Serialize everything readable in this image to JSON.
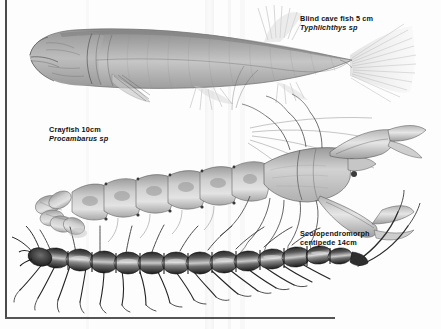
{
  "plate": {
    "title": "Cave fauna illustration plate",
    "background_color": "#fdfdfd",
    "border_color": "#4a4a4a",
    "ink_color": "#3b3b3b",
    "label_color": "#121212"
  },
  "specimens": [
    {
      "id": "blind-cave-fish",
      "common_name": "Blind cave fish",
      "size": "5 cm",
      "label_line1": "Blind cave fish 5 cm",
      "scientific_name": "Typhlichthys sp",
      "genus": "Typhlichthys",
      "qualifier": "sp",
      "position": "top",
      "orientation": "head-left"
    },
    {
      "id": "crayfish",
      "common_name": "Crayfish",
      "size": "10cm",
      "label_line1": "Crayfish 10cm",
      "scientific_name": "Procambarus sp",
      "genus": "Procambarus",
      "qualifier": "sp",
      "position": "middle",
      "orientation": "head-right"
    },
    {
      "id": "centipede",
      "common_name": "Scolopendromorph centipede",
      "size": "14cm",
      "label_line1": "Scolopendromorph",
      "label_line2": "centipede 14cm",
      "scientific_name": "",
      "position": "bottom",
      "orientation": "head-left"
    }
  ]
}
